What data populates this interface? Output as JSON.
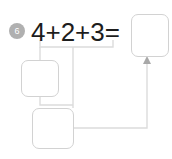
{
  "exercise": {
    "problem_number": "6",
    "equation": "4+2+3=",
    "equation_terms": [
      "4",
      "2",
      "3"
    ],
    "operators": [
      "+",
      "+"
    ],
    "equals_sign": "="
  },
  "boxes": [
    {
      "name": "answer-box-result",
      "value": "",
      "placeholder": ""
    },
    {
      "name": "work-box-left",
      "value": "",
      "placeholder": ""
    },
    {
      "name": "work-box-bottom",
      "value": "",
      "placeholder": ""
    }
  ],
  "colors": {
    "background": "#ffffff",
    "text": "#1d1d1d",
    "badge_fill": "#b0b0b0",
    "badge_text": "#ffffff",
    "box_border": "#d2d2d2",
    "connector": "#dcdcdc",
    "arrow": "#a8a8a8"
  }
}
